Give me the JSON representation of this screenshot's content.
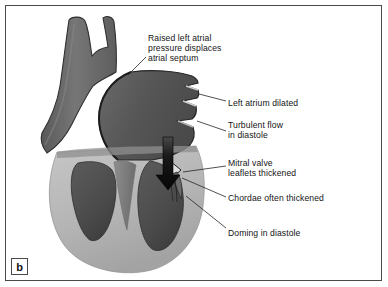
{
  "figure": {
    "panel_label": "b"
  },
  "annotations": [
    {
      "id": "raised-left-atrial-pressure",
      "text": "Raised left atrial\npressure displaces\natrial septum"
    },
    {
      "id": "left-atrium-dilated",
      "text": "Left atrium dilated"
    },
    {
      "id": "turbulent-flow-in-diastole",
      "text": "Turbulent flow\nin diastole"
    },
    {
      "id": "mitral-valve-leaflets-thickened",
      "text": "Mitral valve\nleaflets thickened"
    },
    {
      "id": "chordae-often-thickened",
      "text": "Chordae often thickened"
    },
    {
      "id": "doming-in-diastole",
      "text": "Doming in diastole"
    }
  ],
  "colors": {
    "background": "#ffffff",
    "frame_border": "#4a4a4a",
    "text": "#141414",
    "leader_line": "#2a2a2a",
    "vessel_gray": "#6e6e6e",
    "atrium_gray": "#595959",
    "ventricle_cavity": "#4e4e4e",
    "myocardium_light": "#b9b9b9",
    "myocardium_mid": "#9a9a9a",
    "outline_dark": "#2e2e2e",
    "flow_arrow": "#0d0d0d"
  }
}
